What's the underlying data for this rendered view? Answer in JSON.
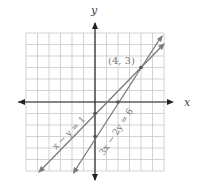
{
  "graph": {
    "axis_labels": {
      "x": "x",
      "y": "y"
    },
    "grid": {
      "xmin": -6,
      "xmax": 6,
      "ymin": -6,
      "ymax": 6,
      "step": 1
    },
    "lines": [
      {
        "equation": "x − y = 1",
        "slope": 1,
        "intercept": -1
      },
      {
        "equation": "3x − 2y = 6",
        "slope": 1.5,
        "intercept": -3
      }
    ],
    "intersection": {
      "label": "(4, 3)",
      "x": 4,
      "y": 3
    },
    "colors": {
      "grid": "#c8c8c8",
      "axis": "#222222",
      "line": "#7a7a7a"
    }
  }
}
